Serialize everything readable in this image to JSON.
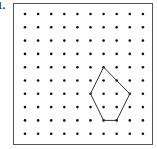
{
  "problem_label": "1.",
  "grid": {
    "columns": 10,
    "rows": 10
  },
  "polygon": {
    "shape": "pentagon",
    "vertices": [
      {
        "col": 6,
        "row": 4
      },
      {
        "col": 8,
        "row": 6
      },
      {
        "col": 7,
        "row": 8
      },
      {
        "col": 6,
        "row": 8
      },
      {
        "col": 5,
        "row": 6
      }
    ]
  },
  "colors": {
    "dot": "#111111",
    "line": "#333333",
    "frame": "#555555"
  }
}
